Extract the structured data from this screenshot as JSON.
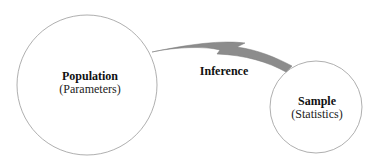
{
  "diagram": {
    "population": {
      "title": "Population",
      "subtitle": "(Parameters)"
    },
    "sample": {
      "title": "Sample",
      "subtitle": "(Statistics)"
    },
    "arrow": {
      "label": "Inference",
      "direction": "sample-to-population"
    },
    "colors": {
      "circle_stroke": "#9a9a9a",
      "arrow_fill": "#8c8c8c",
      "text": "#111111",
      "background": "#ffffff"
    }
  }
}
